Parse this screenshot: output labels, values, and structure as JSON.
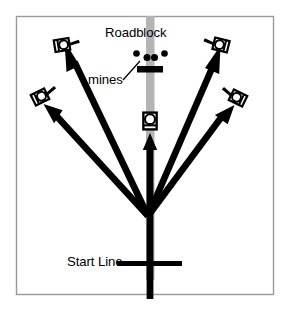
{
  "figure": {
    "background_color": "#ffffff",
    "border_color": "#9a9a9a",
    "road_color": "#b3b3b3",
    "ink_color": "#000000",
    "vehicle_fill": "#ffffff"
  },
  "labels": {
    "roadblock": "Roadblock",
    "mines": "mines",
    "start_line": "Start Line"
  },
  "road": {
    "name": "road-strip",
    "x": 146,
    "y": 16,
    "width": 8,
    "height": 264
  },
  "center_path": {
    "name": "center-route-arrow",
    "start_x": 150,
    "start_y": 298,
    "end_x": 150,
    "end_y": 136
  },
  "start_line": {
    "name": "start-line-marker",
    "x1": 118,
    "y1": 263,
    "x2": 182,
    "y2": 263
  },
  "convergence_point": {
    "x": 148,
    "y": 216
  },
  "roadblock_bar": {
    "name": "roadblock-bar",
    "x": 138,
    "y": 66,
    "width": 25,
    "height": 6
  },
  "mines": [
    {
      "name": "mine-left-outer",
      "cx": 137,
      "cy": 54,
      "r": 3.2
    },
    {
      "name": "mine-center-left",
      "cx": 147,
      "cy": 58,
      "r": 3.4
    },
    {
      "name": "mine-center-right",
      "cx": 154,
      "cy": 58,
      "r": 3.4
    },
    {
      "name": "mine-right-outer",
      "cx": 164,
      "cy": 54,
      "r": 3.2
    }
  ],
  "mines_leader_line": {
    "x1": 124,
    "y1": 80,
    "x2": 140,
    "y2": 62
  },
  "robots": [
    {
      "name": "robot-on-road",
      "position": "center-road",
      "cx": 150,
      "cy": 121,
      "rotation": 0,
      "scale": 1.0
    },
    {
      "name": "robot-upper-left",
      "position": "upper-left",
      "cx": 62,
      "cy": 45,
      "rotation": -8,
      "scale": 1.0
    },
    {
      "name": "robot-lower-left",
      "position": "lower-left",
      "cx": 40,
      "cy": 97,
      "rotation": -28,
      "scale": 1.0
    },
    {
      "name": "robot-upper-right",
      "position": "upper-right",
      "cx": 221,
      "cy": 45,
      "rotation": 18,
      "scale": 1.0
    },
    {
      "name": "robot-lower-right",
      "position": "lower-right",
      "cx": 238,
      "cy": 98,
      "rotation": 28,
      "scale": 1.0
    }
  ],
  "route_arrows": [
    {
      "name": "route-arrow-to-upper-left",
      "x1": 148,
      "y1": 216,
      "x2": 70,
      "y2": 54
    },
    {
      "name": "route-arrow-to-lower-left",
      "x1": 148,
      "y1": 216,
      "x2": 49,
      "y2": 107
    },
    {
      "name": "route-arrow-to-upper-right",
      "x1": 148,
      "y1": 216,
      "x2": 216,
      "y2": 58
    },
    {
      "name": "route-arrow-to-lower-right",
      "x1": 148,
      "y1": 216,
      "x2": 228,
      "y2": 110
    }
  ],
  "border": {
    "x": 16,
    "y": 16,
    "width": 258,
    "height": 279
  }
}
